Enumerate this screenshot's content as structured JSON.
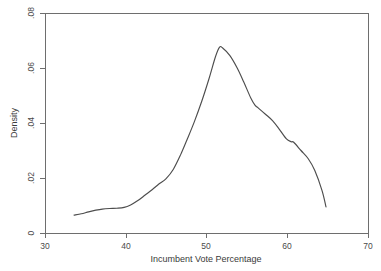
{
  "figure": {
    "background_color": "#ffffff",
    "frame_color": "#6e6e6e",
    "curve_color": "#4d4d4d",
    "text_color": "#3a3a3a"
  },
  "axes": {
    "x_title": "Incumbent Vote Percentage",
    "y_title": "Density",
    "x_ticks": [
      "30",
      "40",
      "50",
      "60",
      "70"
    ],
    "y_ticks": [
      "0",
      ".02",
      ".04",
      ".06",
      ".08"
    ]
  },
  "chart_data": {
    "type": "line",
    "title": "",
    "subtitle": "",
    "xlabel": "Incumbent Vote Percentage",
    "ylabel": "Density",
    "xlim": [
      30,
      70
    ],
    "ylim": [
      0,
      0.08
    ],
    "xticks": [
      30,
      40,
      50,
      60,
      70
    ],
    "yticks": [
      0,
      0.02,
      0.04,
      0.06,
      0.08
    ],
    "grid": false,
    "legend": false,
    "legend_position": "none",
    "annotations": [],
    "series": [
      {
        "name": "Kernel density of incumbent vote percentage",
        "x": [
          33.6,
          34.5,
          35.4,
          36.3,
          37.1,
          38.0,
          38.9,
          39.8,
          40.6,
          41.5,
          42.4,
          43.3,
          44.1,
          45.0,
          45.9,
          46.8,
          47.6,
          48.5,
          49.4,
          50.3,
          51.1,
          51.6,
          52.0,
          52.9,
          53.8,
          54.6,
          55.5,
          56.0,
          56.4,
          57.3,
          58.2,
          59.0,
          59.9,
          60.5,
          60.8,
          61.7,
          62.6,
          63.4,
          64.3,
          64.8
        ],
        "y": [
          0.0065,
          0.007,
          0.0077,
          0.0083,
          0.0087,
          0.0089,
          0.009,
          0.0093,
          0.0102,
          0.0118,
          0.0138,
          0.0158,
          0.0178,
          0.0198,
          0.0232,
          0.0285,
          0.034,
          0.0405,
          0.0478,
          0.056,
          0.064,
          0.0675,
          0.0673,
          0.0645,
          0.06,
          0.055,
          0.049,
          0.0465,
          0.0455,
          0.0432,
          0.0408,
          0.0378,
          0.0342,
          0.0332,
          0.033,
          0.03,
          0.027,
          0.0228,
          0.0155,
          0.0095
        ]
      }
    ]
  }
}
